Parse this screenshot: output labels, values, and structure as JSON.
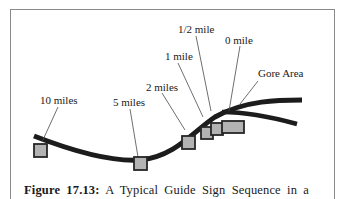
{
  "figure": {
    "caption_label": "Figure 17.13:",
    "caption_text": "A Typical Guide Sign Sequence in a",
    "labels": {
      "ten_miles": "10 miles",
      "five_miles": "5 miles",
      "two_miles": "2 miles",
      "one_mile": "1 mile",
      "half_mile": "1/2 mile",
      "zero_mile": "0 mile",
      "gore_area": "Gore Area"
    },
    "colors": {
      "road": "#1c1c1c",
      "sign_fill": "#b3b3b3",
      "sign_stroke": "#262626",
      "leader": "#4a4a4a",
      "frame": "#8a8a8a"
    }
  }
}
